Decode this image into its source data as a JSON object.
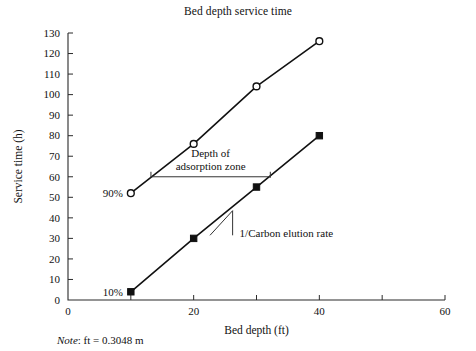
{
  "figure": {
    "note_prefix": "Note",
    "note_text": ": ft = 0.3048 m"
  },
  "chart_data": {
    "type": "line",
    "title": "Bed depth service time",
    "xlabel": "Bed depth (ft)",
    "ylabel": "Service time (h)",
    "xlim": [
      0,
      60
    ],
    "ylim": [
      0,
      130
    ],
    "grid": false,
    "legend": "none",
    "x_ticks": [
      0,
      10,
      20,
      30,
      40,
      50,
      60
    ],
    "x_tick_labels": [
      "0",
      "",
      "20",
      "",
      "40",
      "",
      "60"
    ],
    "y_ticks": [
      0,
      10,
      20,
      30,
      40,
      50,
      60,
      70,
      80,
      90,
      100,
      110,
      120,
      130
    ],
    "y_tick_labels": [
      "0",
      "10",
      "20",
      "30",
      "40",
      "50",
      "60",
      "70",
      "80",
      "90",
      "100",
      "110",
      "120",
      "130"
    ],
    "series": [
      {
        "name": "90%",
        "marker": "open-circle",
        "x": [
          10,
          20,
          30,
          40
        ],
        "values": [
          52,
          76,
          104,
          126
        ]
      },
      {
        "name": "10%",
        "marker": "filled-square",
        "x": [
          10,
          20,
          30,
          40
        ],
        "values": [
          4,
          30,
          55,
          80
        ]
      }
    ],
    "annotations": [
      {
        "id": "series-label-90",
        "text": "90%",
        "x": 10,
        "y": 52
      },
      {
        "id": "series-label-10",
        "text": "10%",
        "x": 10,
        "y": 4
      },
      {
        "id": "adsorption-zone",
        "text_line1": "Depth of",
        "text_line2": "adsorption zone",
        "arrow_from_x": 13.2,
        "arrow_to_x": 32.2,
        "arrow_y": 60
      },
      {
        "id": "elution-rate",
        "text": "1/Carbon elution rate",
        "triangle_x": [
          22.6,
          26.2,
          26.2
        ],
        "triangle_y": [
          31.5,
          43.5,
          31.5
        ]
      }
    ]
  }
}
